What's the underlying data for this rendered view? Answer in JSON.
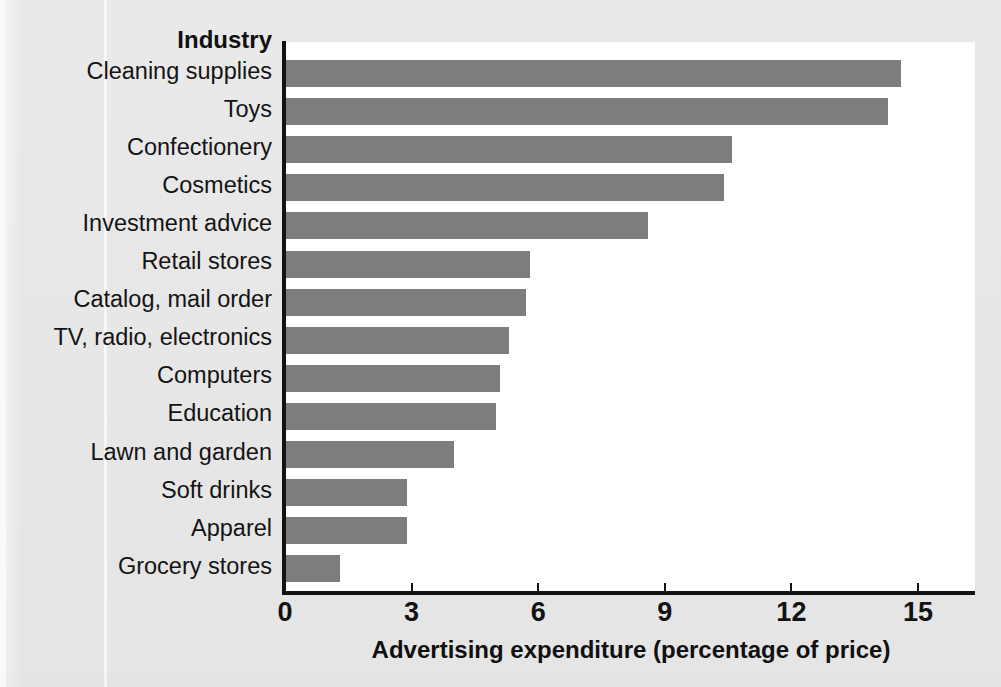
{
  "chart_data": {
    "type": "bar",
    "orientation": "horizontal",
    "title": "",
    "xlabel": "Advertising expenditure (percentage of price)",
    "ylabel": "Industry",
    "categories": [
      "Cleaning supplies",
      "Toys",
      "Confectionery",
      "Cosmetics",
      "Investment advice",
      "Retail stores",
      "Catalog, mail order",
      "TV, radio, electronics",
      "Computers",
      "Education",
      "Lawn and garden",
      "Soft drinks",
      "Apparel",
      "Grocery stores"
    ],
    "values": [
      14.6,
      14.3,
      10.6,
      10.4,
      8.6,
      5.8,
      5.7,
      5.3,
      5.1,
      5.0,
      4.0,
      2.9,
      2.9,
      1.3
    ],
    "xlim": [
      0,
      15
    ],
    "xticks": [
      0,
      3,
      6,
      9,
      12,
      15
    ],
    "xtick_labels": [
      "0",
      "3",
      "6",
      "9",
      "12",
      "15"
    ],
    "grid": false,
    "legend": false,
    "bar_color": "#7d7d7d",
    "axis_color": "#131313",
    "plot_background": "#ffffff",
    "page_background": "#e9e9e9"
  },
  "axis": {
    "y_header": "Industry",
    "x_title": "Advertising expenditure (percentage of price)"
  }
}
